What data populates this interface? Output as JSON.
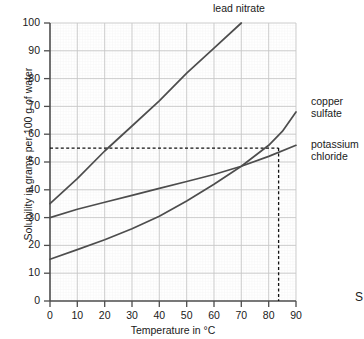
{
  "chart_data": {
    "type": "line",
    "title": "",
    "xlabel": "Temperature in °C",
    "ylabel": "Solubility in grams per 100 g of water",
    "xlim": [
      0,
      90
    ],
    "ylim": [
      0,
      100
    ],
    "xticks": [
      0,
      10,
      20,
      30,
      40,
      50,
      60,
      70,
      80,
      90
    ],
    "yticks": [
      0,
      10,
      20,
      30,
      40,
      50,
      60,
      70,
      80,
      90,
      100
    ],
    "grid": "minor grid every 1 unit, major grid every 10 units",
    "legend_position": "inline labels at curve ends",
    "series": [
      {
        "name": "lead nitrate",
        "label_position": "top",
        "color": "#4d4d4d",
        "x": [
          0,
          10,
          20,
          30,
          40,
          50,
          60,
          70
        ],
        "values": [
          35,
          44,
          54,
          63,
          72,
          82,
          91,
          100
        ]
      },
      {
        "name": "potassium chloride",
        "label_position": "right",
        "color": "#4d4d4d",
        "x": [
          0,
          10,
          20,
          30,
          40,
          50,
          60,
          70,
          80,
          90
        ],
        "values": [
          30,
          33,
          35.5,
          38,
          40.5,
          43,
          45.5,
          48.5,
          52,
          56
        ]
      },
      {
        "name": "copper sulfate",
        "label_position": "right",
        "color": "#4d4d4d",
        "x": [
          0,
          10,
          20,
          30,
          40,
          50,
          60,
          70,
          80,
          90
        ],
        "values": [
          15,
          18.5,
          22,
          26,
          30.5,
          36,
          42,
          48.5,
          56,
          68
        ]
      }
    ],
    "annotations": [
      {
        "type": "dashed-horizontal",
        "value": 55,
        "from_x": 0,
        "to_x": 80,
        "description": "solubility 55 g per 100 g of water"
      },
      {
        "type": "dashed-vertical",
        "value": 80,
        "from_y": 0,
        "to_y": 55,
        "description": "temperature 80 °C"
      }
    ]
  },
  "labels": {
    "lead_nitrate": "lead nitrate",
    "copper_sulfate": "copper\nsulfate",
    "potassium_chloride": "potassium\nchloride",
    "xaxis_title": "Temperature in °C",
    "yaxis_title": "Solubility in grams per 100 g of water",
    "cut_off_right_text": "S"
  },
  "colors": {
    "curve": "#4d4d4d",
    "axis": "#4d4d4d",
    "major_grid": "#c9c9c9",
    "minor_grid": "#e9e9e9",
    "text": "#1a1a1a",
    "background": "#ffffff"
  }
}
